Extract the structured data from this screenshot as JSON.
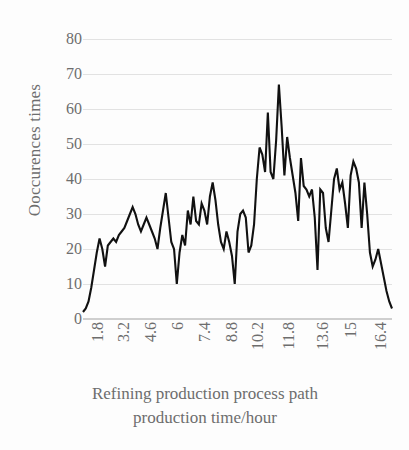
{
  "chart_data": {
    "type": "line",
    "title": "",
    "subtitle": "",
    "xlabel": "Refining production process path production time/hour",
    "xlabel_line1": "Refining production process path",
    "xlabel_line2": "production time/hour",
    "ylabel": "Ooccurences times",
    "ylim": [
      0,
      80
    ],
    "y_ticks": [
      0,
      10,
      20,
      30,
      40,
      50,
      60,
      70,
      80
    ],
    "x_tick_labels": [
      "1.8",
      "3.2",
      "4.6",
      "6",
      "7.4",
      "8.8",
      "10.2",
      "11.8",
      "13.6",
      "15",
      "16.4"
    ],
    "x_tick_positions_frac": [
      0.022,
      0.108,
      0.195,
      0.281,
      0.368,
      0.455,
      0.541,
      0.64,
      0.752,
      0.842,
      0.938
    ],
    "grid": "horizontal",
    "legend": "none",
    "series_color": "#111111",
    "grid_color": "#e2e2e2",
    "axis_color": "#cfcfcf",
    "text_color": "#6d6d6d",
    "series": [
      {
        "name": "Occurrences",
        "values": [
          2,
          3,
          5,
          9,
          14,
          19,
          23,
          20,
          15,
          21,
          22,
          23,
          22,
          24,
          25,
          26,
          28,
          30,
          32,
          30,
          27,
          25,
          27,
          29,
          27,
          25,
          23,
          20,
          26,
          31,
          36,
          29,
          22,
          20,
          10,
          19,
          24,
          21,
          31,
          27,
          35,
          28,
          27,
          33,
          31,
          27,
          35,
          39,
          34,
          27,
          22,
          20,
          25,
          22,
          18,
          10,
          25,
          30,
          31,
          29,
          19,
          21,
          27,
          40,
          49,
          47,
          42,
          59,
          42,
          40,
          51,
          67,
          55,
          41,
          52,
          46,
          41,
          36,
          28,
          46,
          38,
          37,
          35,
          37,
          29,
          14,
          37,
          36,
          26,
          22,
          31,
          40,
          43,
          37,
          39,
          33,
          26,
          41,
          45,
          43,
          39,
          26,
          39,
          30,
          19,
          15,
          17,
          20,
          16,
          12,
          8,
          5,
          3
        ]
      }
    ],
    "notable_points": {
      "max_value": 67,
      "min_value": 2,
      "peak_region_x": "11.8"
    }
  },
  "figure": {
    "background": "#fdfdfd"
  }
}
